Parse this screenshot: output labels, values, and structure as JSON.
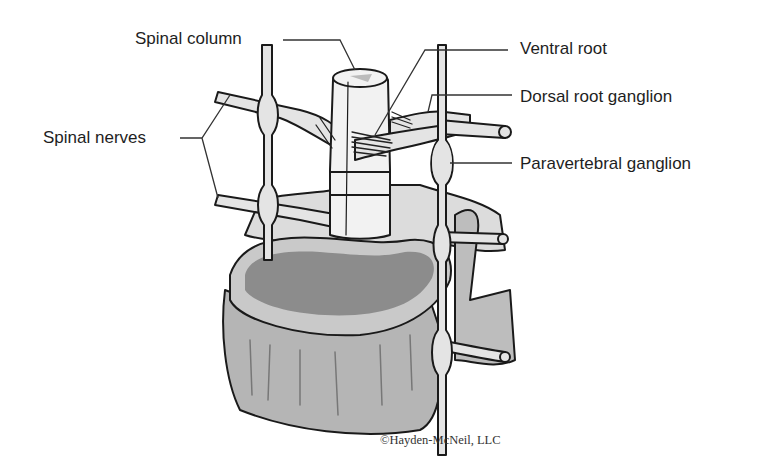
{
  "diagram": {
    "labels": {
      "spinal_column": "Spinal column",
      "ventral_root": "Ventral root",
      "dorsal_root_ganglion": "Dorsal root ganglion",
      "paravertebral_ganglion": "Paravertebral ganglion",
      "spinal_nerves": "Spinal nerves"
    },
    "copyright": "©Hayden-McNeil, LLC",
    "colors": {
      "outline": "#1a1a1a",
      "light_fill": "#e4e4e4",
      "mid_fill": "#c9c9c9",
      "dark_fill": "#8c8c8c",
      "cord_fill": "#f2f2f2"
    }
  }
}
